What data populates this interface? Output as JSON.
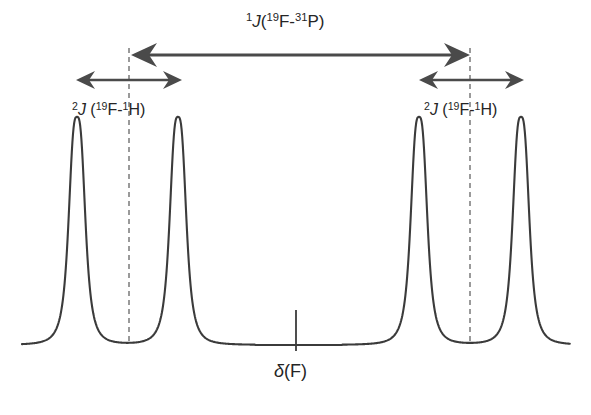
{
  "figure": {
    "background_color": "#ffffff",
    "trace_color": "#3b3b3b",
    "guide_color": "#7a7a7a",
    "arrow_color": "#4a4a4a",
    "text_color": "#252525"
  },
  "labels": {
    "coupling_large": {
      "sup_order": "1",
      "j": "J",
      "open_paren": "(",
      "nuc1_mass": "19",
      "nuc1": "F",
      "dash": "-",
      "nuc2_mass": "31",
      "nuc2": "P",
      "close_paren": ")",
      "plain": "1J(19F-31P)"
    },
    "coupling_small_left": {
      "sup_order": "2",
      "j": "J",
      "space": " ",
      "open_paren": "(",
      "nuc1_mass": "19",
      "nuc1": "F",
      "dash": "-",
      "nuc2_mass": "1",
      "nuc2": "H",
      "close_paren": ")",
      "plain": "2J (19F-1H)"
    },
    "coupling_small_right": {
      "sup_order": "2",
      "j": "J",
      "space": " ",
      "open_paren": "(",
      "nuc1_mass": "19",
      "nuc1": "F",
      "dash": "-",
      "nuc2_mass": "1",
      "nuc2": "H",
      "close_paren": ")",
      "plain": "2J (19F-1H)"
    },
    "chemical_shift": {
      "delta": "δ",
      "nucleus": "(F)",
      "plain": "δ(F)"
    }
  },
  "chart_data": {
    "type": "line",
    "title": "",
    "xlabel": "",
    "ylabel": "",
    "grid": false,
    "legend": null,
    "axis": {
      "baseline_y_px": 345,
      "baseline_x_start_px": 22,
      "baseline_x_end_px": 570,
      "peak_top_y_px": 117
    },
    "peaks": [
      {
        "id": "p1",
        "center_px": 77,
        "height_px": 228,
        "half_width_px": 9,
        "relative_intensity": 1.0
      },
      {
        "id": "p2",
        "center_px": 178,
        "height_px": 228,
        "half_width_px": 9,
        "relative_intensity": 1.0
      },
      {
        "id": "p3",
        "center_px": 419,
        "height_px": 228,
        "half_width_px": 9,
        "relative_intensity": 1.0
      },
      {
        "id": "p4",
        "center_px": 521,
        "height_px": 228,
        "half_width_px": 9,
        "relative_intensity": 1.0
      }
    ],
    "dashed_guides": [
      {
        "id": "left-doublet-center",
        "x_px": 129,
        "y_top_px": 48,
        "y_bottom_px": 345
      },
      {
        "id": "right-doublet-center",
        "x_px": 470,
        "y_top_px": 48,
        "y_bottom_px": 345
      }
    ],
    "center_tick": {
      "x_px": 296,
      "y_top_px": 310,
      "y_bottom_px": 351
    },
    "arrows": [
      {
        "id": "arrow-large-coupling",
        "label_ref": "coupling_large",
        "y_px": 55,
        "x_start_px": 131,
        "x_end_px": 470,
        "double_headed": true,
        "span_px": 339
      },
      {
        "id": "arrow-small-coupling-left",
        "label_ref": "coupling_small_left",
        "y_px": 80,
        "x_start_px": 76,
        "x_end_px": 182,
        "double_headed": true,
        "span_px": 106
      },
      {
        "id": "arrow-small-coupling-right",
        "label_ref": "coupling_small_right",
        "y_px": 80,
        "x_start_px": 419,
        "x_end_px": 524,
        "double_headed": true,
        "span_px": 105
      }
    ]
  }
}
